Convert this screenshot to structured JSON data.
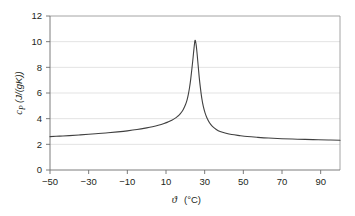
{
  "chart_data": {
    "type": "line",
    "title": "",
    "xlabel": "ϑ (°C)",
    "ylabel": "c_P (J/(gK))",
    "xlabel_symbol": "ϑ",
    "xlabel_unit": "(°C)",
    "ylabel_symbol": "c",
    "ylabel_subscript": "P",
    "ylabel_unit": "(J/(gK))",
    "xlim": [
      -50,
      100
    ],
    "ylim": [
      0,
      12
    ],
    "xticks": [
      -50,
      -30,
      -10,
      10,
      30,
      50,
      70,
      90
    ],
    "xtick_labels": [
      "−50",
      "−30",
      "−10",
      "10",
      "30",
      "50",
      "70",
      "90"
    ],
    "yticks": [
      0,
      2,
      4,
      6,
      8,
      10,
      12
    ],
    "ytick_labels": [
      "0",
      "2",
      "4",
      "6",
      "8",
      "10",
      "12"
    ],
    "grid": "horizontal",
    "grid_color": "#e3e3e3",
    "legend": "none",
    "line_color": "#404040",
    "line_width": 1.1,
    "peak": {
      "x": 25,
      "y": 10.1
    },
    "series": [
      {
        "name": "cP",
        "x": [
          -50,
          -45,
          -40,
          -35,
          -30,
          -25,
          -20,
          -15,
          -10,
          -5,
          0,
          3,
          6,
          9,
          11,
          13,
          15,
          16,
          17,
          18,
          19,
          20,
          20.8,
          21.5,
          22.2,
          22.8,
          23.4,
          24,
          24.5,
          25,
          25.5,
          26,
          26.6,
          27.2,
          27.8,
          28.5,
          29.3,
          30.2,
          31.2,
          32.5,
          34,
          36,
          38,
          41,
          44,
          48,
          52,
          57,
          63,
          70,
          78,
          86,
          94,
          100
        ],
        "y": [
          2.6,
          2.64,
          2.68,
          2.73,
          2.78,
          2.84,
          2.9,
          2.97,
          3.05,
          3.15,
          3.28,
          3.37,
          3.48,
          3.62,
          3.74,
          3.88,
          4.06,
          4.18,
          4.32,
          4.5,
          4.74,
          5.06,
          5.4,
          5.85,
          6.45,
          7.1,
          7.9,
          8.75,
          9.5,
          10.1,
          9.85,
          9.2,
          8.2,
          7.2,
          6.4,
          5.6,
          4.95,
          4.45,
          4.05,
          3.68,
          3.4,
          3.16,
          3.0,
          2.86,
          2.76,
          2.68,
          2.61,
          2.55,
          2.49,
          2.44,
          2.4,
          2.37,
          2.34,
          2.32
        ]
      }
    ]
  }
}
